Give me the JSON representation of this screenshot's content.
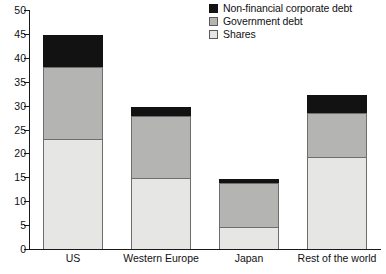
{
  "chart_data": {
    "type": "bar",
    "stacked": true,
    "title": "",
    "subtitle": "",
    "xlabel": "",
    "ylabel": "",
    "ylim": [
      0,
      50
    ],
    "ytick_step": 5,
    "yticks": [
      0,
      5,
      10,
      15,
      20,
      25,
      30,
      35,
      40,
      45,
      50
    ],
    "ytick_labels": [
      "0",
      "5",
      "10",
      "15",
      "20",
      "25",
      "30",
      "35",
      "40",
      "45",
      "50"
    ],
    "grid": false,
    "legend_position": "top-right",
    "categories": [
      "US",
      "Western Europe",
      "Japan",
      "Rest of the world"
    ],
    "series": [
      {
        "name": "Shares",
        "color": "#e6e6e4",
        "values": [
          23.0,
          14.8,
          4.7,
          19.3
        ]
      },
      {
        "name": "Government debt",
        "color": "#b4b4b2",
        "values": [
          15.0,
          13.1,
          9.1,
          9.1
        ]
      },
      {
        "name": "Non-financial corporate debt",
        "color": "#121212",
        "values": [
          6.8,
          1.8,
          0.8,
          3.8
        ]
      }
    ],
    "totals": [
      44.8,
      29.7,
      14.6,
      32.2
    ],
    "legend_order": [
      "Non-financial corporate debt",
      "Government debt",
      "Shares"
    ]
  },
  "legend": {
    "items": [
      {
        "label": "Non-financial corporate debt",
        "color": "#121212"
      },
      {
        "label": "Government debt",
        "color": "#b4b4b2"
      },
      {
        "label": "Shares",
        "color": "#e6e6e4"
      }
    ]
  },
  "axis": {
    "y_tick_labels": [
      "50",
      "45",
      "40",
      "35",
      "30",
      "25",
      "20",
      "15",
      "10",
      "5",
      "0"
    ],
    "x_category_labels": [
      "US",
      "Western Europe",
      "Japan",
      "Rest of the world"
    ]
  }
}
